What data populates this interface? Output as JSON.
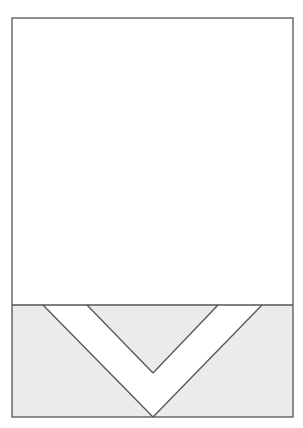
{
  "diagram": {
    "colors": {
      "stroke": "#555555",
      "background": "#ffffff",
      "lower_fill": "#ebebeb",
      "chevron_fill": "#ffffff"
    },
    "frame": {
      "x": 12,
      "y": 18,
      "width": 281,
      "height": 399
    },
    "divider_y": 305,
    "chevron": {
      "outer": {
        "left_x": 43,
        "right_x": 262,
        "top_y": 305,
        "apex_x": 153,
        "apex_y": 417
      },
      "inner": {
        "left_x": 87,
        "right_x": 218,
        "top_y": 305,
        "apex_x": 153,
        "apex_y": 373
      }
    }
  }
}
